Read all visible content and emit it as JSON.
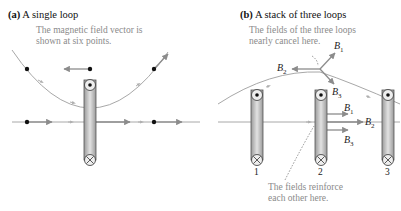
{
  "panel_a": {
    "tag": "(a)",
    "title": "A single loop",
    "note_line1": "The magnetic field vector is",
    "note_line2": "shown at six points."
  },
  "panel_b": {
    "tag": "(b)",
    "title": "A stack of three loops",
    "note_top_line1": "The fields of the three loops",
    "note_top_line2": "nearly cancel here.",
    "note_bottom_line1": "The fields reinforce",
    "note_bottom_line2": "each other here.",
    "loop_labels": [
      "1",
      "2",
      "3"
    ],
    "vectors_top": [
      {
        "sym": "B",
        "sub": "1"
      },
      {
        "sym": "B",
        "sub": "2"
      },
      {
        "sym": "B",
        "sub": "3"
      }
    ],
    "vectors_bottom": [
      {
        "sym": "B",
        "sub": "1"
      },
      {
        "sym": "B",
        "sub": "2"
      },
      {
        "sym": "B",
        "sub": "3"
      }
    ]
  },
  "colors": {
    "field_line": "#a8a8a8",
    "vector": "#8c8c8c",
    "wire_fill": "#c8c8c8",
    "note_text": "#8a8a8a"
  }
}
